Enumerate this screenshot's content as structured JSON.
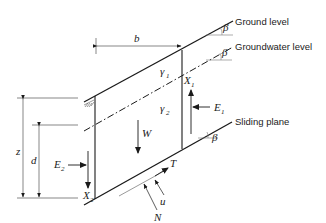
{
  "diagram": {
    "type": "infinite-slope-stability",
    "labels": {
      "ground_level": "Ground level",
      "groundwater_level": "Groundwater level",
      "sliding_plane": "Sliding plane"
    },
    "symbols": {
      "width": "b",
      "slope_angle": "β",
      "unit_weight_1": "γ",
      "unit_weight_1_sub": "1",
      "unit_weight_2": "γ",
      "unit_weight_2_sub": "2",
      "weight": "W",
      "normal_force": "N",
      "shear_force": "T",
      "pore_pressure": "u",
      "earth_force_1": "E",
      "earth_force_1_sub": "1",
      "earth_force_2": "E",
      "earth_force_2_sub": "2",
      "shear_1": "X",
      "shear_1_sub": "1",
      "shear_2": "X",
      "shear_2_sub": "2",
      "depth_total": "z",
      "depth_water": "d"
    },
    "colors": {
      "line": "#1a1a1a",
      "thin": "#555555",
      "background": "#ffffff"
    }
  }
}
